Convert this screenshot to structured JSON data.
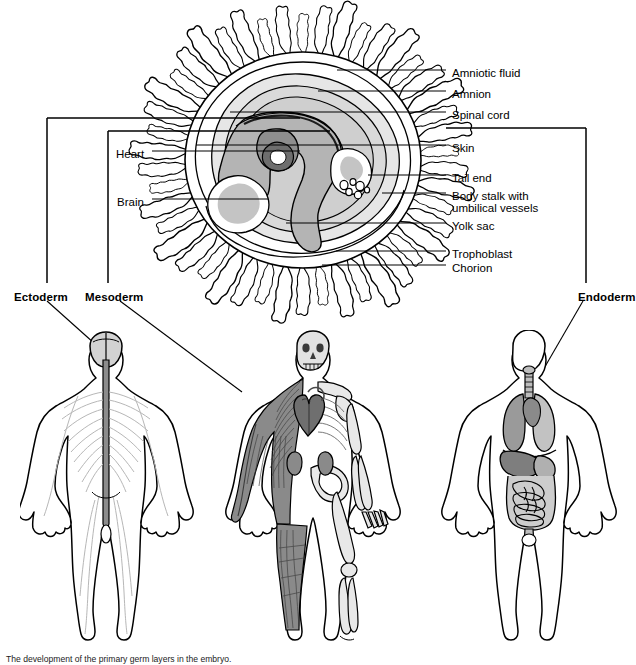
{
  "figure": {
    "caption": "The development of the primary germ layers in the embryo."
  },
  "embryo_labels": [
    {
      "id": "amniotic-fluid",
      "text": "Amniotic fluid",
      "x": 452,
      "y": 67,
      "line_y": 70,
      "line_x1": 337,
      "line_x2": 446
    },
    {
      "id": "amnion",
      "text": "Amnion",
      "x": 452,
      "y": 88,
      "line_y": 91,
      "line_x1": 318,
      "line_x2": 446
    },
    {
      "id": "spinal-cord",
      "text": "Spinal cord",
      "x": 452,
      "y": 109,
      "line_y": 112,
      "line_x1": 230,
      "line_x2": 446
    },
    {
      "id": "skin",
      "text": "Skin",
      "x": 452,
      "y": 142,
      "line_y": 145,
      "line_x1": 196,
      "line_x2": 446
    },
    {
      "id": "tail-end",
      "text": "Tail end",
      "x": 452,
      "y": 172,
      "line_y": 175,
      "line_x1": 368,
      "line_x2": 446
    },
    {
      "id": "body-stalk",
      "text": "Body stalk with",
      "x": 452,
      "y": 190,
      "line_y": 193,
      "line_x1": 382,
      "line_x2": 446
    },
    {
      "id": "body-stalk-2",
      "text": "umbilical vessels",
      "x": 452,
      "y": 202,
      "line_y": null,
      "line_x1": null,
      "line_x2": null
    },
    {
      "id": "yolk-sac",
      "text": "Yolk sac",
      "x": 452,
      "y": 220,
      "line_y": 223,
      "line_x1": 286,
      "line_x2": 446
    },
    {
      "id": "trophoblast",
      "text": "Trophoblast",
      "x": 452,
      "y": 248,
      "line_y": 251,
      "line_x1": 336,
      "line_x2": 446
    },
    {
      "id": "chorion",
      "text": "Chorion",
      "x": 452,
      "y": 262,
      "line_y": 265,
      "line_x1": 322,
      "line_x2": 446
    }
  ],
  "embryo_labels_left": [
    {
      "id": "heart",
      "text": "Heart",
      "x": 116,
      "y": 148,
      "line_y": 151,
      "line_x1": 152,
      "line_x2": 300
    },
    {
      "id": "brain",
      "text": "Brain",
      "x": 117,
      "y": 196,
      "line_y": 199,
      "line_x1": 152,
      "line_x2": 268
    }
  ],
  "germ_layers": [
    {
      "id": "ectoderm",
      "label": "Ectoderm",
      "label_x": 14,
      "label_y": 291,
      "bracket": {
        "x": 47,
        "y_top": 118,
        "y_bottom": 283,
        "x_end": 300
      },
      "leader": {
        "x1": 47,
        "y1": 301,
        "x2": 104,
        "y2": 352
      },
      "derivatives": [
        "brain",
        "spinal cord",
        "nerves",
        "skin"
      ]
    },
    {
      "id": "mesoderm",
      "label": "Mesoderm",
      "label_x": 85,
      "label_y": 291,
      "bracket": {
        "x": 108,
        "y_top": 131,
        "y_bottom": 283,
        "x_end": 330
      },
      "leader": {
        "x1": 120,
        "y1": 301,
        "x2": 242,
        "y2": 392
      },
      "derivatives": [
        "muscle",
        "bone",
        "heart",
        "kidneys"
      ]
    },
    {
      "id": "endoderm",
      "label": "Endoderm",
      "label_x": 578,
      "label_y": 291,
      "bracket": {
        "x": 586,
        "y_top": 128,
        "y_bottom": 283,
        "x_end": 446
      },
      "leader": {
        "x1": 583,
        "y1": 301,
        "x2": 528,
        "y2": 396
      },
      "derivatives": [
        "lungs",
        "trachea",
        "liver",
        "intestines"
      ]
    }
  ],
  "body_figures": [
    {
      "id": "ectoderm-figure",
      "name": "Nervous system figure",
      "systems": [
        "brain",
        "spinal cord",
        "peripheral nerves"
      ]
    },
    {
      "id": "mesoderm-figure",
      "name": "Musculoskeletal figure",
      "systems": [
        "skeletal muscle",
        "bones",
        "heart",
        "kidneys"
      ]
    },
    {
      "id": "endoderm-figure",
      "name": "Digestive / respiratory figure",
      "systems": [
        "lungs",
        "trachea",
        "liver",
        "stomach",
        "intestines"
      ]
    }
  ],
  "colors": {
    "outline": "#000000",
    "amnion_fill": "#d9d9d9",
    "embryo_fill": "#a8a8a8",
    "embryo_dark": "#8e8e8e",
    "heart_fill": "#6e6e6e",
    "organ_light": "#c9c9c9",
    "organ_mid": "#9a9a9a",
    "organ_dark": "#707070",
    "background": "#ffffff"
  }
}
